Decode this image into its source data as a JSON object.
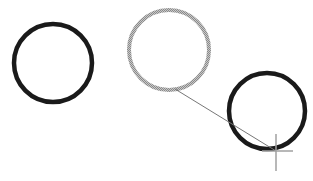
{
  "canvas": {
    "width": 313,
    "height": 181,
    "background": "#ffffff"
  },
  "shapes": {
    "circles": [
      {
        "id": "circle-left",
        "cx": 53,
        "cy": 63,
        "r": 39,
        "stroke": "#1a1a1a",
        "stroke_width": 4.5,
        "state": "normal"
      },
      {
        "id": "circle-middle",
        "cx": 169,
        "cy": 50,
        "r": 40,
        "stroke": "#9a9a9a",
        "stroke_width": 4,
        "state": "selected-ghost"
      },
      {
        "id": "circle-right",
        "cx": 267,
        "cy": 111,
        "r": 38,
        "stroke": "#1a1a1a",
        "stroke_width": 4.5,
        "state": "normal"
      }
    ],
    "drag_line": {
      "x1": 175,
      "y1": 89,
      "x2": 276,
      "y2": 151,
      "stroke": "#777777",
      "stroke_width": 1
    },
    "crosshair": {
      "cx": 276,
      "cy": 151,
      "h_left": 262,
      "h_right": 293,
      "v_top": 134,
      "v_bottom": 171,
      "stroke": "#a0a0a0",
      "stroke_width": 1.5
    }
  },
  "icons": {
    "cursor": "crosshair-cursor-icon"
  }
}
